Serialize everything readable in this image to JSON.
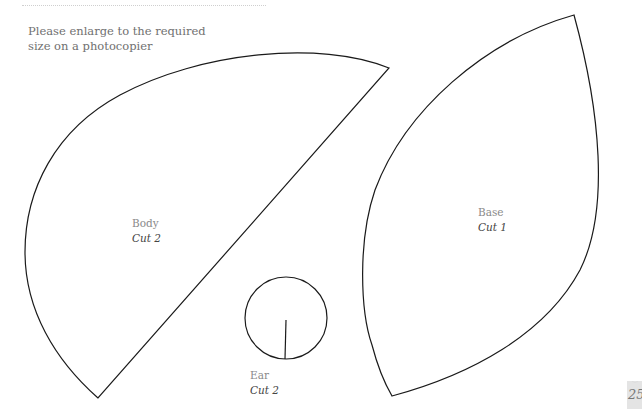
{
  "instruction": "Please enlarge to the required size on a photocopier",
  "pieces": [
    {
      "name": "Body",
      "cut": "Cut 2"
    },
    {
      "name": "Base",
      "cut": "Cut 1"
    },
    {
      "name": "Ear",
      "cut": "Cut 2"
    }
  ],
  "page_number": "25",
  "colors": {
    "outline": "#1a1a1a",
    "label": "#8a8a8a",
    "text": "#707070"
  }
}
